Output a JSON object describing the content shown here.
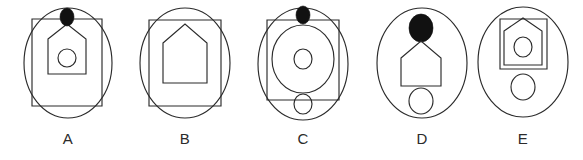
{
  "image": {
    "kind": "abstract-reasoning-figure-set",
    "background_color": "#ffffff",
    "line_color": "#2b2b2b",
    "fill_color": "#111111",
    "width": 583,
    "height": 160,
    "figure_count": 5
  },
  "figures": [
    {
      "id": "figure-a",
      "label": "A",
      "left": 8,
      "width": 120,
      "shapes": [
        {
          "name": "outer-ellipse",
          "type": "ellipse",
          "cx": 60,
          "cy": 63,
          "rx": 44,
          "ry": 55
        },
        {
          "name": "square-frame",
          "type": "rect",
          "x": 24,
          "y": 19,
          "w": 70,
          "h": 87
        },
        {
          "name": "house-pentagon",
          "type": "polygon",
          "points": "40,39 59,24 78,39 78,74 40,74"
        },
        {
          "name": "inner-circle",
          "type": "ellipse",
          "cx": 59,
          "cy": 58,
          "rx": 9,
          "ry": 9
        },
        {
          "name": "black-dot",
          "type": "ellipse",
          "cx": 59,
          "cy": 17,
          "rx": 7,
          "ry": 9,
          "filled": true
        }
      ]
    },
    {
      "id": "figure-b",
      "label": "B",
      "left": 125,
      "width": 120,
      "shapes": [
        {
          "name": "outer-ellipse",
          "type": "ellipse",
          "cx": 60,
          "cy": 63,
          "rx": 45,
          "ry": 55
        },
        {
          "name": "square-frame",
          "type": "rect",
          "x": 24,
          "y": 20,
          "w": 72,
          "h": 86
        },
        {
          "name": "house-pentagon",
          "type": "polygon",
          "points": "38,43 60,24 82,43 82,83 38,83"
        }
      ]
    },
    {
      "id": "figure-c",
      "label": "C",
      "left": 242,
      "width": 122,
      "shapes": [
        {
          "name": "outer-ellipse",
          "type": "ellipse",
          "cx": 61,
          "cy": 64,
          "rx": 45,
          "ry": 56
        },
        {
          "name": "square-frame",
          "type": "rect",
          "x": 25,
          "y": 20,
          "w": 72,
          "h": 80
        },
        {
          "name": "large-inner-ellipse",
          "type": "ellipse",
          "cx": 61,
          "cy": 59,
          "rx": 31,
          "ry": 34
        },
        {
          "name": "inner-circle",
          "type": "ellipse",
          "cx": 61,
          "cy": 59,
          "rx": 9,
          "ry": 10
        },
        {
          "name": "black-dot",
          "type": "ellipse",
          "cx": 61,
          "cy": 15,
          "rx": 7,
          "ry": 9,
          "filled": true
        },
        {
          "name": "bottom-circle",
          "type": "ellipse",
          "cx": 61,
          "cy": 104,
          "rx": 9,
          "ry": 10
        }
      ]
    },
    {
      "id": "figure-d",
      "label": "D",
      "left": 362,
      "width": 120,
      "shapes": [
        {
          "name": "outer-ellipse",
          "type": "ellipse",
          "cx": 60,
          "cy": 63,
          "rx": 45,
          "ry": 55
        },
        {
          "name": "black-dot",
          "type": "ellipse",
          "cx": 59,
          "cy": 28,
          "rx": 12,
          "ry": 14,
          "filled": true
        },
        {
          "name": "house-pentagon",
          "type": "polygon",
          "points": "39,58 59,41 79,58 79,86 39,86"
        },
        {
          "name": "bottom-circle",
          "type": "ellipse",
          "cx": 59,
          "cy": 101,
          "rx": 12,
          "ry": 13
        }
      ]
    },
    {
      "id": "figure-e",
      "label": "E",
      "left": 463,
      "width": 120,
      "shapes": [
        {
          "name": "outer-ellipse",
          "type": "ellipse",
          "cx": 60,
          "cy": 62,
          "rx": 45,
          "ry": 55
        },
        {
          "name": "square-frame",
          "type": "rect",
          "x": 37,
          "y": 19,
          "w": 47,
          "h": 50
        },
        {
          "name": "house-pentagon",
          "type": "polygon",
          "points": "41,31 60,18 79,31 79,65 41,65"
        },
        {
          "name": "inner-circle",
          "type": "ellipse",
          "cx": 60,
          "cy": 47,
          "rx": 9,
          "ry": 10
        },
        {
          "name": "bottom-circle",
          "type": "ellipse",
          "cx": 60,
          "cy": 87,
          "rx": 12,
          "ry": 13
        }
      ]
    }
  ]
}
